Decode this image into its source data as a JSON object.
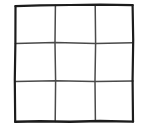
{
  "figure": {
    "name": "hand-drawn-3x3-grid",
    "canvas": {
      "width": 148,
      "height": 133
    },
    "background_color": "#ffffff"
  },
  "style": {
    "outer_stroke_color": "#1c1c1c",
    "inner_stroke_color": "#4a4a4a",
    "outer_stroke_width": 2.2,
    "inner_stroke_width": 1.5,
    "cell_fill_color": "#ffffff"
  },
  "grid": {
    "rows": 3,
    "columns": 3,
    "bounds": {
      "left": 15,
      "top": 5,
      "right": 133,
      "bottom": 122
    },
    "vertical_line_x": [
      55,
      95
    ],
    "horizontal_line_y": [
      43,
      81
    ],
    "outer_border": {
      "top_path": "M15.5,6.2 L40,5.4 L70,5.0 L100,4.6 L132.6,5.2",
      "right_path": "M132.6,5.2 L133.2,40 L132.6,80 L133.0,121.6",
      "bottom_path": "M133.0,121.6 L100,121.0 L70,121.8 L40,121.2 L15.2,121.8",
      "left_path": "M15.2,121.8 L14.8,80 L15.4,42 L15.5,6.2"
    },
    "inner_lines": [
      {
        "name": "vertical-line-1",
        "path": "M55.4,5.6 L55.0,43 L55.6,81 L55.2,121.4"
      },
      {
        "name": "vertical-line-2",
        "path": "M95.2,5.0 L95.6,43 L95.0,81 L95.4,121.2"
      },
      {
        "name": "horizontal-line-1",
        "path": "M15.4,43.4 L55.0,42.6 L95.6,43.4 L132.8,42.8"
      },
      {
        "name": "horizontal-line-2",
        "path": "M15.0,81.6 L55.6,80.8 L95.0,81.6 L133.0,81.0"
      }
    ],
    "cells": [
      {
        "id": "cell-r1c1",
        "row": 1,
        "col": 1,
        "label": "",
        "x": 15,
        "y": 5,
        "w": 40,
        "h": 38
      },
      {
        "id": "cell-r1c2",
        "row": 1,
        "col": 2,
        "label": "",
        "x": 55,
        "y": 5,
        "w": 40,
        "h": 38
      },
      {
        "id": "cell-r1c3",
        "row": 1,
        "col": 3,
        "label": "",
        "x": 95,
        "y": 5,
        "w": 38,
        "h": 38
      },
      {
        "id": "cell-r2c1",
        "row": 2,
        "col": 1,
        "label": "",
        "x": 15,
        "y": 43,
        "w": 40,
        "h": 38
      },
      {
        "id": "cell-r2c2",
        "row": 2,
        "col": 2,
        "label": "",
        "x": 55,
        "y": 43,
        "w": 40,
        "h": 38
      },
      {
        "id": "cell-r2c3",
        "row": 2,
        "col": 3,
        "label": "",
        "x": 95,
        "y": 43,
        "w": 38,
        "h": 38
      },
      {
        "id": "cell-r3c1",
        "row": 3,
        "col": 1,
        "label": "",
        "x": 15,
        "y": 81,
        "w": 40,
        "h": 41
      },
      {
        "id": "cell-r3c2",
        "row": 3,
        "col": 2,
        "label": "",
        "x": 55,
        "y": 81,
        "w": 40,
        "h": 41
      },
      {
        "id": "cell-r3c3",
        "row": 3,
        "col": 3,
        "label": "",
        "x": 95,
        "y": 81,
        "w": 38,
        "h": 41
      }
    ]
  }
}
